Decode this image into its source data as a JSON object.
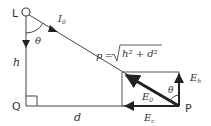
{
  "diagram": {
    "points": {
      "L": "L",
      "Q": "Q",
      "P": "P"
    },
    "labels": {
      "h": "h",
      "d": "d",
      "theta_top": "θ",
      "theta_right": "θ",
      "intensity": "I",
      "intensity_sub": "0",
      "distance_formula": "p = √h² + d²",
      "p": "p",
      "eq": "=",
      "sqrt_body": "h² + d²",
      "E0": "E",
      "E0_sub": "0",
      "Eh": "E",
      "Eh_sub": "h",
      "Ec": "E",
      "Ec_sub": "c"
    },
    "colors": {
      "line": "#444444",
      "thick_vector": "#222222",
      "text": "#333333"
    }
  }
}
